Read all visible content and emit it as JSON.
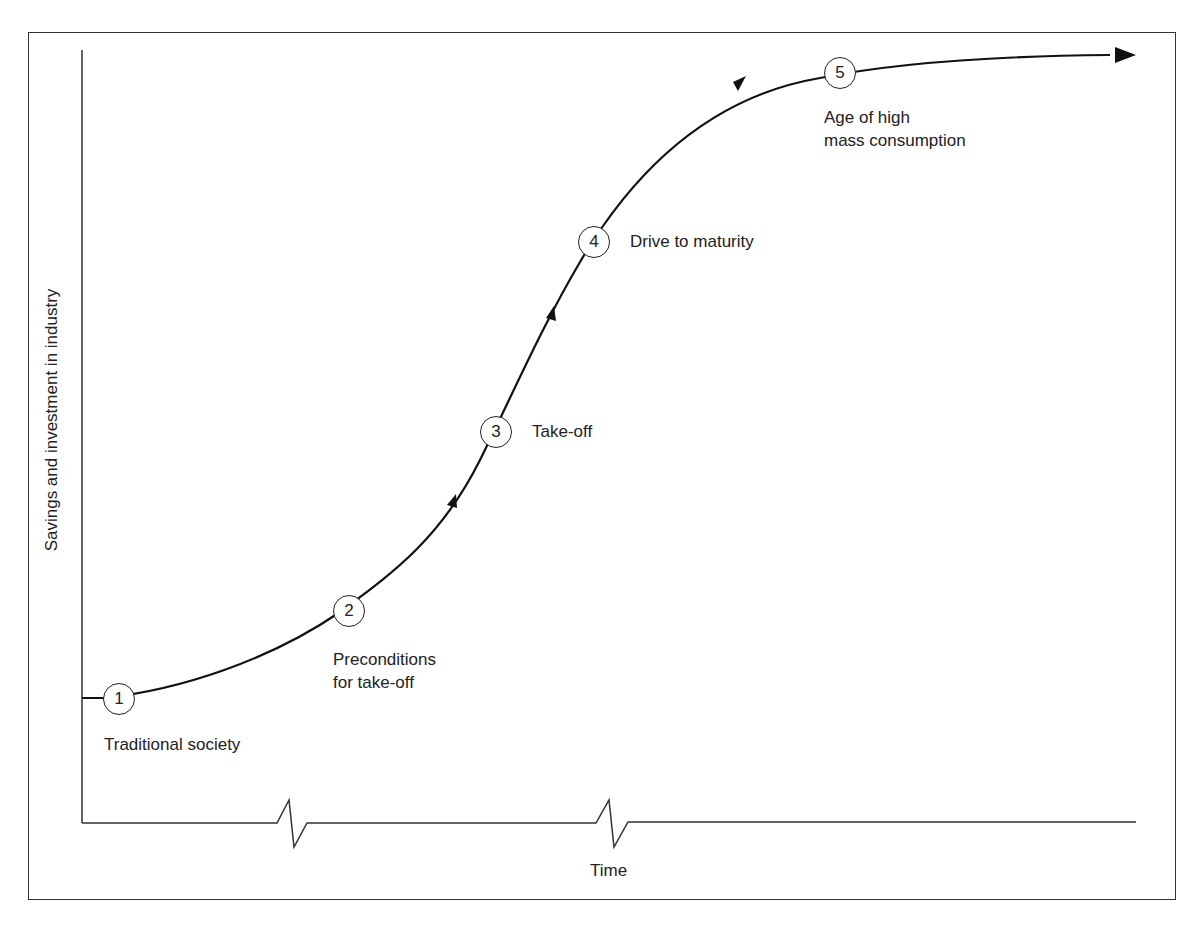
{
  "diagram": {
    "type": "s-curve stage model",
    "axes": {
      "y_label": "Savings and investment in industry",
      "x_label": "Time"
    },
    "stages": [
      {
        "number": "1",
        "label": "Traditional society"
      },
      {
        "number": "2",
        "label_line1": "Preconditions",
        "label_line2": "for take-off"
      },
      {
        "number": "3",
        "label": "Take-off"
      },
      {
        "number": "4",
        "label": "Drive to maturity"
      },
      {
        "number": "5",
        "label_line1": "Age of high",
        "label_line2": "mass consumption"
      }
    ],
    "colors": {
      "line": "#111111",
      "frame": "#333333",
      "background": "#ffffff"
    }
  }
}
